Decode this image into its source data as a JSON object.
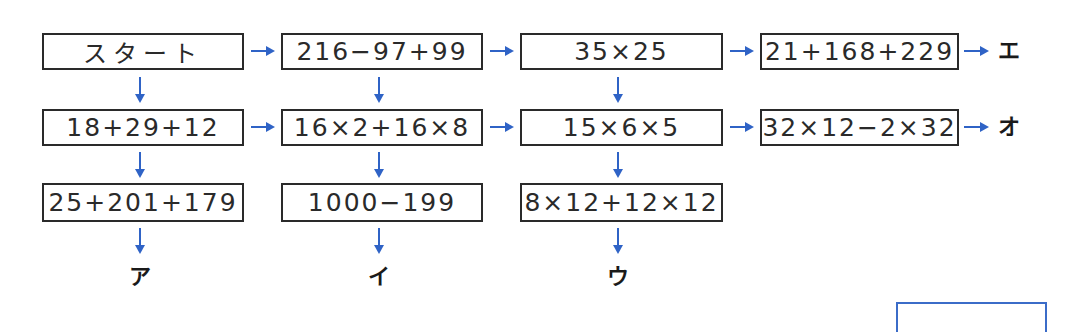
{
  "diagram": {
    "type": "flow-maze",
    "colors": {
      "box_border": "#2a2a2a",
      "arrow": "#2f63c6",
      "answer_box_border": "#3b6cc8"
    },
    "rows": [
      {
        "boxes": [
          "スタート",
          "216−97+99",
          "35×25",
          "21+168+229"
        ],
        "exit_label": "エ"
      },
      {
        "boxes": [
          "18+29+12",
          "16×2+16×8",
          "15×6×5",
          "32×12−2×32"
        ],
        "exit_label": "オ"
      },
      {
        "boxes": [
          "25+201+179",
          "1000−199",
          "8×12+12×12"
        ],
        "exit_label": null
      }
    ],
    "bottom_labels": [
      "ア",
      "イ",
      "ウ"
    ],
    "answer_box": {
      "value": ""
    }
  }
}
